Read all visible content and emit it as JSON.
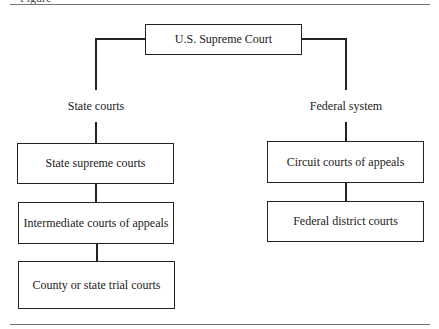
{
  "diagram": {
    "type": "hierarchy",
    "caption_fragment": "Figure",
    "root": {
      "label": "U.S. Supreme Court"
    },
    "branches": [
      {
        "label": "State courts",
        "levels": [
          "State supreme courts",
          "Intermediate courts of appeals",
          "County or state trial courts"
        ]
      },
      {
        "label": "Federal system",
        "levels": [
          "Circuit courts of appeals",
          "Federal district courts"
        ]
      }
    ]
  }
}
